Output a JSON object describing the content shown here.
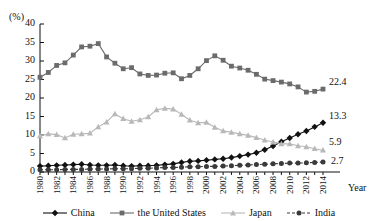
{
  "chart_data": {
    "type": "line",
    "title": "",
    "xlabel": "Year",
    "ylabel": "(%)",
    "yunit": "(%)",
    "ylim": [
      0,
      40
    ],
    "yticks": [
      0,
      5,
      10,
      15,
      20,
      25,
      30,
      35,
      40
    ],
    "grid": false,
    "legend_position": "bottom",
    "x": [
      1980,
      1981,
      1982,
      1983,
      1984,
      1985,
      1986,
      1987,
      1988,
      1989,
      1990,
      1991,
      1992,
      1993,
      1994,
      1995,
      1996,
      1997,
      1998,
      1999,
      2000,
      2001,
      2002,
      2003,
      2004,
      2005,
      2006,
      2007,
      2008,
      2009,
      2010,
      2011,
      2012,
      2013,
      2014
    ],
    "xtick_labels": [
      "1980",
      "1982",
      "1984",
      "1986",
      "1988",
      "1990",
      "1992",
      "1994",
      "1996",
      "1998",
      "2000",
      "2002",
      "2004",
      "2006",
      "2008",
      "2010",
      "2012",
      "2014"
    ],
    "series": [
      {
        "name": "China",
        "color": "#111111",
        "marker": "diamond",
        "dash": "solid",
        "end_label": "13.3",
        "values": [
          1.6,
          1.7,
          1.8,
          1.9,
          2.0,
          2.1,
          1.9,
          1.8,
          1.8,
          1.9,
          1.7,
          1.6,
          1.7,
          1.7,
          1.8,
          2.0,
          2.2,
          2.6,
          2.9,
          3.0,
          3.2,
          3.4,
          3.6,
          3.9,
          4.3,
          4.7,
          5.2,
          6.0,
          7.0,
          8.2,
          9.2,
          10.2,
          11.1,
          12.2,
          13.3
        ]
      },
      {
        "name": "the United States",
        "color": "#6b6b6b",
        "marker": "square",
        "dash": "solid",
        "end_label": "22.4",
        "values": [
          25.6,
          26.9,
          28.8,
          29.5,
          31.6,
          33.8,
          34.0,
          34.7,
          31.1,
          29.4,
          27.9,
          28.2,
          26.5,
          26.1,
          26.2,
          26.7,
          26.8,
          25.2,
          26.1,
          27.9,
          30.1,
          31.4,
          30.2,
          28.6,
          28.1,
          27.5,
          26.4,
          25.1,
          24.7,
          24.3,
          23.8,
          23.0,
          21.6,
          21.8,
          22.4
        ]
      },
      {
        "name": "Japan",
        "color": "#b8b8b8",
        "marker": "triangle",
        "dash": "solid",
        "end_label": "5.9",
        "values": [
          9.8,
          10.3,
          10.1,
          9.2,
          10.2,
          10.3,
          10.5,
          12.2,
          13.5,
          15.7,
          14.4,
          13.7,
          14.1,
          14.9,
          16.8,
          17.2,
          17.0,
          15.6,
          14.0,
          13.3,
          13.4,
          12.1,
          11.1,
          10.7,
          10.3,
          9.9,
          9.3,
          8.6,
          8.1,
          7.6,
          7.6,
          7.1,
          6.8,
          6.3,
          5.9
        ]
      },
      {
        "name": "India",
        "color": "#3a3a3a",
        "marker": "circle",
        "dash": "dashed",
        "end_label": "2.7",
        "values": [
          0.6,
          0.6,
          0.6,
          0.7,
          0.7,
          0.7,
          0.8,
          0.8,
          0.8,
          0.9,
          0.9,
          0.9,
          1.0,
          1.0,
          1.1,
          1.2,
          1.2,
          1.3,
          1.4,
          1.4,
          1.5,
          1.5,
          1.6,
          1.7,
          1.8,
          1.9,
          2.0,
          2.1,
          2.2,
          2.3,
          2.4,
          2.4,
          2.5,
          2.6,
          2.7
        ]
      }
    ]
  }
}
